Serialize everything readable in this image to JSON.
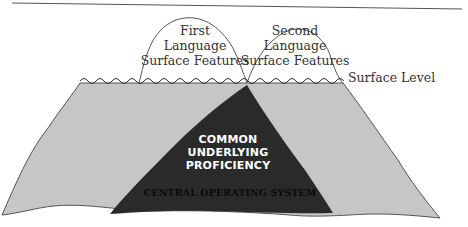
{
  "diagram": {
    "type": "dual-iceberg",
    "colors": {
      "background": "#ffffff",
      "water_body": "#c6c6c6",
      "core": "#2a2a2a",
      "outline": "#555555",
      "header_rule": "#555555"
    },
    "peaks": [
      {
        "lines": [
          "First",
          "Language",
          "Surface Features"
        ]
      },
      {
        "lines": [
          "Second",
          "Language",
          "Surface Features"
        ]
      }
    ],
    "surface_label": "Surface Level",
    "core": {
      "lines": [
        "COMMON",
        "UNDERLYING",
        "PROFICIENCY"
      ],
      "base_label": "CENTRAL OPERATING SYSTEM"
    }
  }
}
